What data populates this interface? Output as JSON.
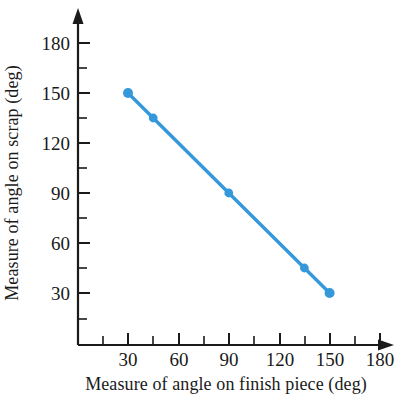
{
  "chart_data": {
    "type": "line",
    "title": "",
    "xlabel": "Measure of angle on finish piece (deg)",
    "ylabel": "Measure of angle on scrap (deg)",
    "xlim": [
      0,
      195
    ],
    "ylim": [
      0,
      195
    ],
    "x_ticks": [
      30,
      60,
      90,
      120,
      150,
      180
    ],
    "y_ticks": [
      30,
      60,
      90,
      120,
      150,
      180
    ],
    "x_tick_labels": [
      "30",
      "60",
      "90",
      "120",
      "150",
      "180"
    ],
    "y_tick_labels": [
      "30",
      "60",
      "90",
      "120",
      "150",
      "180"
    ],
    "x_minor_step": 15,
    "y_minor_step": 15,
    "grid": false,
    "legend": false,
    "axis_arrows": true,
    "series": [
      {
        "name": "scrap angle vs finish angle",
        "color": "#3498db",
        "marker": "circle",
        "x": [
          30,
          45,
          90,
          135,
          150
        ],
        "y": [
          150,
          135,
          90,
          45,
          30
        ],
        "points": [
          {
            "x": 30,
            "y": 150
          },
          {
            "x": 45,
            "y": 135
          },
          {
            "x": 90,
            "y": 90
          },
          {
            "x": 135,
            "y": 45
          },
          {
            "x": 150,
            "y": 30
          }
        ]
      }
    ]
  },
  "colors": {
    "series": "#3498db",
    "axis": "#1a1a1a",
    "background": "#ffffff"
  }
}
